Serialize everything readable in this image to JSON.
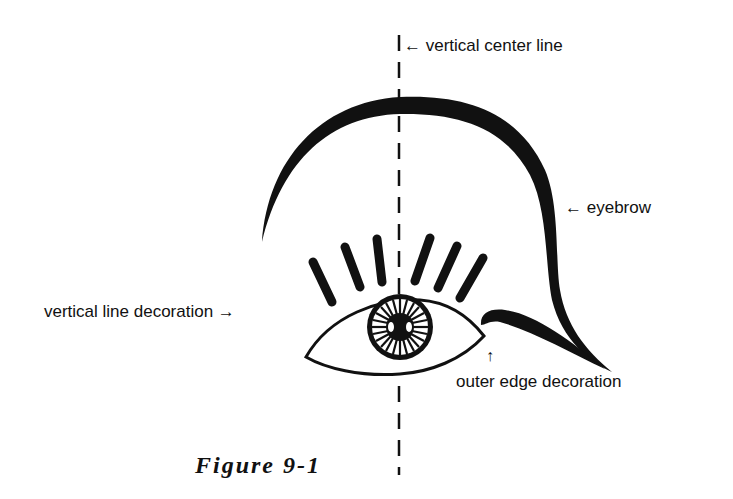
{
  "diagram": {
    "labels": {
      "center_line": "← vertical center line",
      "eyebrow": "← eyebrow",
      "lash_decoration": "vertical line decoration →",
      "outer_edge_arrow": "↑",
      "outer_edge": "outer edge decoration"
    },
    "caption": "Figure 9-1",
    "colors": {
      "ink": "#111111",
      "background": "#ffffff"
    }
  }
}
